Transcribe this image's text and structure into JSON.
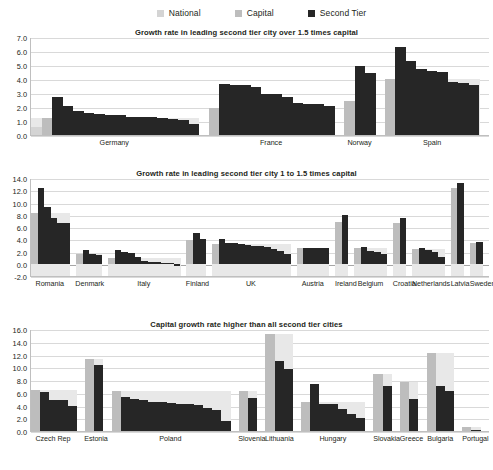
{
  "legend": {
    "items": [
      {
        "label": "National",
        "color": "#d4d4d4",
        "icon": "square-swatch-icon"
      },
      {
        "label": "Capital",
        "color": "#bdbdbd",
        "icon": "square-swatch-icon"
      },
      {
        "label": "Second Tier",
        "color": "#262626",
        "icon": "square-swatch-icon"
      }
    ]
  },
  "chart_data": [
    {
      "type": "bar",
      "title": "Growth rate in leading second tier city over 1.5 times capital",
      "xlabel": "",
      "ylabel": "",
      "ylim": [
        0.0,
        7.0
      ],
      "yticks": [
        "0.0",
        "1.0",
        "2.0",
        "3.0",
        "4.0",
        "5.0",
        "6.0",
        "7.0"
      ],
      "grid": true,
      "legend_position": "top-center",
      "categories": [
        "Germany",
        "France",
        "Norway",
        "Spain"
      ],
      "groups": [
        {
          "name": "Germany",
          "national": 0.55,
          "capital": 1.2,
          "second_tier": [
            2.75,
            2.1,
            1.75,
            1.6,
            1.5,
            1.45,
            1.4,
            1.3,
            1.3,
            1.3,
            1.2,
            1.15,
            1.1,
            0.8
          ]
        },
        {
          "name": "France",
          "national": null,
          "capital": 1.9,
          "second_tier": [
            3.65,
            3.6,
            3.55,
            3.4,
            2.95,
            2.9,
            2.75,
            2.3,
            2.25,
            2.2,
            2.05
          ]
        },
        {
          "name": "Norway",
          "national": null,
          "capital": 2.4,
          "second_tier": [
            4.9,
            4.4
          ]
        },
        {
          "name": "Spain",
          "national": null,
          "capital": 4.0,
          "second_tier": [
            6.3,
            5.3,
            4.7,
            4.55,
            4.5,
            3.8,
            3.75,
            3.55
          ]
        }
      ]
    },
    {
      "type": "bar",
      "title": "Growth rate in leading second tier city 1 to 1.5 times capital",
      "xlabel": "",
      "ylabel": "",
      "ylim": [
        -2.0,
        14.0
      ],
      "yticks": [
        "-2.0",
        "0.0",
        "2.0",
        "4.0",
        "6.0",
        "8.0",
        "10.0",
        "12.0",
        "14.0"
      ],
      "grid": true,
      "legend_position": "top-center",
      "categories": [
        "Romania",
        "Denmark",
        "Italy",
        "Finland",
        "UK",
        "Austria",
        "Ireland",
        "Belgium",
        "Croatia",
        "Netherlands",
        "Latvia",
        "Sweden"
      ],
      "groups": [
        {
          "name": "Romania",
          "national": null,
          "capital": 8.25,
          "second_tier": [
            12.3,
            9.3,
            7.4,
            6.6,
            6.6
          ]
        },
        {
          "name": "Denmark",
          "national": null,
          "capital": 1.55,
          "second_tier": [
            2.25,
            1.65,
            1.5
          ]
        },
        {
          "name": "Italy",
          "national": null,
          "capital": 1.0,
          "second_tier": [
            2.2,
            1.95,
            1.75,
            1.05,
            0.45,
            0.3,
            0.25,
            0.2,
            0.15,
            -0.3
          ]
        },
        {
          "name": "Finland",
          "national": null,
          "capital": 3.8,
          "second_tier": [
            4.95,
            4.1
          ]
        },
        {
          "name": "UK",
          "national": null,
          "capital": 3.25,
          "second_tier": [
            4.1,
            3.4,
            3.35,
            3.2,
            3.1,
            2.95,
            2.9,
            2.7,
            2.4,
            2.1,
            1.65
          ]
        },
        {
          "name": "Austria",
          "national": null,
          "capital": 2.55,
          "second_tier": [
            2.6,
            2.6,
            2.55,
            2.5
          ]
        },
        {
          "name": "Ireland",
          "national": null,
          "capital": 6.9,
          "second_tier": [
            7.9
          ]
        },
        {
          "name": "Belgium",
          "national": null,
          "capital": 2.55,
          "second_tier": [
            2.8,
            2.1,
            1.9,
            1.6
          ]
        },
        {
          "name": "Croatia",
          "national": null,
          "capital": 6.7,
          "second_tier": [
            7.5
          ]
        },
        {
          "name": "Netherlands",
          "national": null,
          "capital": 2.4,
          "second_tier": [
            2.55,
            2.2,
            1.85,
            1.1
          ]
        },
        {
          "name": "Latvia",
          "national": null,
          "capital": 12.4,
          "second_tier": [
            13.2
          ]
        },
        {
          "name": "Sweden",
          "national": null,
          "capital": 3.35,
          "second_tier": [
            3.5
          ]
        }
      ]
    },
    {
      "type": "bar",
      "title": "Capital growth rate higher than all second tier cities",
      "xlabel": "",
      "ylabel": "",
      "ylim": [
        0.0,
        16.0
      ],
      "yticks": [
        "0.0",
        "2.0",
        "4.0",
        "6.0",
        "8.0",
        "10.0",
        "12.0",
        "14.0",
        "16.0"
      ],
      "grid": true,
      "legend_position": "top-center",
      "categories": [
        "Czech Rep",
        "Estonia",
        "Poland",
        "Slovenia",
        "Lithuania",
        "Hungary",
        "Slovakia",
        "Greece",
        "Bulgaria",
        "Portugal"
      ],
      "groups": [
        {
          "name": "Czech Rep",
          "national": null,
          "capital": 6.5,
          "second_tier": [
            6.05,
            4.8,
            4.8,
            3.85
          ]
        },
        {
          "name": "Estonia",
          "national": null,
          "capital": 11.35,
          "second_tier": [
            10.4
          ]
        },
        {
          "name": "Poland",
          "national": null,
          "capital": 6.2,
          "second_tier": [
            5.3,
            4.95,
            4.8,
            4.6,
            4.5,
            4.35,
            4.25,
            4.2,
            4.15,
            3.6,
            3.35,
            1.6
          ]
        },
        {
          "name": "Slovenia",
          "national": null,
          "capital": 6.2,
          "second_tier": [
            5.2
          ]
        },
        {
          "name": "Lithuania",
          "national": null,
          "capital": 15.2,
          "second_tier": [
            11.0,
            9.7
          ]
        },
        {
          "name": "Hungary",
          "national": null,
          "capital": 4.6,
          "second_tier": [
            7.3,
            4.2,
            4.2,
            3.4,
            2.6,
            2.1
          ]
        },
        {
          "name": "Slovakia",
          "national": null,
          "capital": 9.0,
          "second_tier": [
            7.0
          ]
        },
        {
          "name": "Greece",
          "national": null,
          "capital": 7.7,
          "second_tier": [
            5.0
          ]
        },
        {
          "name": "Bulgaria",
          "national": null,
          "capital": 12.2,
          "second_tier": [
            7.0,
            6.2
          ]
        },
        {
          "name": "Portugal",
          "national": null,
          "capital": 0.7,
          "second_tier": [
            0.2
          ]
        }
      ]
    }
  ]
}
